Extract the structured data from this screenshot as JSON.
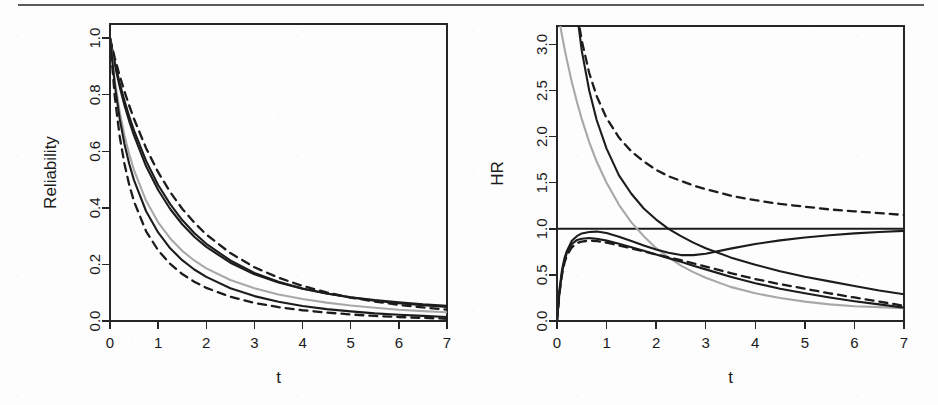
{
  "figure": {
    "panel_count": 2,
    "background_color": "#fdfdfd",
    "rule_color": "#5a5a5a",
    "ink_color": "#1c1c1c",
    "gray_curve_color": "#a8a8a8"
  },
  "chart_data": [
    {
      "type": "line",
      "panel_name": "reliability-panel",
      "title": "",
      "xlabel": "t",
      "ylabel": "Reliability",
      "xlim": [
        0,
        7
      ],
      "ylim": [
        0,
        1.05
      ],
      "xticks": [
        0,
        1,
        2,
        3,
        4,
        5,
        6,
        7
      ],
      "xticklabels": [
        "0",
        "1",
        "2",
        "3",
        "4",
        "5",
        "6",
        "7"
      ],
      "yticks": [
        0.0,
        0.2,
        0.4,
        0.6,
        0.8,
        1.0
      ],
      "yticklabels": [
        "0.0",
        "0.2",
        "0.4",
        "0.6",
        "0.8",
        "1.0"
      ],
      "grid": false,
      "legend": "none",
      "x": [
        0,
        0.1,
        0.2,
        0.3,
        0.4,
        0.5,
        0.75,
        1,
        1.25,
        1.5,
        1.75,
        2,
        2.5,
        3,
        3.5,
        4,
        4.5,
        5,
        5.5,
        6,
        6.5,
        7
      ],
      "series": [
        {
          "name": "upper-dashed-bound",
          "style": "dashed",
          "color": "#1c1c1c",
          "values": [
            1.0,
            0.93,
            0.868,
            0.812,
            0.761,
            0.714,
            0.611,
            0.526,
            0.456,
            0.397,
            0.348,
            0.306,
            0.24,
            0.19,
            0.153,
            0.124,
            0.101,
            0.083,
            0.069,
            0.057,
            0.048,
            0.04
          ]
        },
        {
          "name": "upper-solid-a",
          "style": "solid",
          "color": "#1c1c1c",
          "values": [
            1.0,
            0.914,
            0.842,
            0.779,
            0.723,
            0.673,
            0.566,
            0.481,
            0.413,
            0.357,
            0.311,
            0.273,
            0.214,
            0.17,
            0.139,
            0.115,
            0.097,
            0.083,
            0.072,
            0.063,
            0.056,
            0.05
          ]
        },
        {
          "name": "upper-solid-b",
          "style": "solid",
          "color": "#1c1c1c",
          "values": [
            1.0,
            0.906,
            0.829,
            0.763,
            0.706,
            0.655,
            0.547,
            0.463,
            0.396,
            0.342,
            0.298,
            0.262,
            0.206,
            0.165,
            0.136,
            0.114,
            0.097,
            0.084,
            0.074,
            0.066,
            0.059,
            0.054
          ]
        },
        {
          "name": "gray-median",
          "style": "solid",
          "color": "#a8a8a8",
          "values": [
            1.0,
            0.851,
            0.741,
            0.657,
            0.589,
            0.533,
            0.425,
            0.349,
            0.292,
            0.248,
            0.214,
            0.186,
            0.145,
            0.116,
            0.094,
            0.078,
            0.065,
            0.055,
            0.047,
            0.04,
            0.035,
            0.031
          ]
        },
        {
          "name": "lower-solid",
          "style": "solid",
          "color": "#1c1c1c",
          "values": [
            1.0,
            0.834,
            0.716,
            0.626,
            0.555,
            0.497,
            0.388,
            0.313,
            0.257,
            0.215,
            0.182,
            0.156,
            0.116,
            0.088,
            0.068,
            0.053,
            0.042,
            0.034,
            0.027,
            0.022,
            0.018,
            0.014
          ]
        },
        {
          "name": "lower-dashed-bound",
          "style": "dashed",
          "color": "#1c1c1c",
          "values": [
            1.0,
            0.792,
            0.654,
            0.556,
            0.481,
            0.422,
            0.317,
            0.25,
            0.202,
            0.166,
            0.139,
            0.117,
            0.086,
            0.064,
            0.049,
            0.038,
            0.03,
            0.023,
            0.018,
            0.014,
            0.011,
            0.008
          ]
        }
      ]
    },
    {
      "type": "line",
      "panel_name": "hr-panel",
      "title": "",
      "xlabel": "t",
      "ylabel": "HR",
      "xlim": [
        0,
        7
      ],
      "ylim": [
        0,
        3.2
      ],
      "xticks": [
        0,
        1,
        2,
        3,
        4,
        5,
        6,
        7
      ],
      "xticklabels": [
        "0",
        "1",
        "2",
        "3",
        "4",
        "5",
        "6",
        "7"
      ],
      "yticks": [
        0.0,
        0.5,
        1.0,
        1.5,
        2.0,
        2.5,
        3.0
      ],
      "yticklabels": [
        "0.0",
        "0.5",
        "1.0",
        "1.5",
        "2.0",
        "2.5",
        "3.0"
      ],
      "grid": false,
      "legend": "none",
      "x": [
        0,
        0.05,
        0.1,
        0.15,
        0.2,
        0.3,
        0.4,
        0.5,
        0.65,
        0.8,
        1,
        1.25,
        1.5,
        1.75,
        2,
        2.25,
        2.5,
        2.75,
        3,
        3.5,
        4,
        4.5,
        5,
        5.5,
        6,
        6.5,
        7
      ],
      "series": [
        {
          "name": "constant-hr-one",
          "style": "solid",
          "color": "#1c1c1c",
          "values": [
            1.0,
            1.0,
            1.0,
            1.0,
            1.0,
            1.0,
            1.0,
            1.0,
            1.0,
            1.0,
            1.0,
            1.0,
            1.0,
            1.0,
            1.0,
            1.0,
            1.0,
            1.0,
            1.0,
            1.0,
            1.0,
            1.0,
            1.0,
            1.0,
            1.0,
            1.0,
            1.0
          ]
        },
        {
          "name": "upper-dashed-decay",
          "style": "dashed",
          "color": "#1c1c1c",
          "values": [
            6.2,
            5.6,
            5.1,
            4.7,
            4.35,
            3.78,
            3.36,
            3.04,
            2.69,
            2.44,
            2.2,
            1.99,
            1.84,
            1.73,
            1.64,
            1.57,
            1.52,
            1.47,
            1.43,
            1.36,
            1.31,
            1.27,
            1.24,
            1.21,
            1.19,
            1.17,
            1.15
          ]
        },
        {
          "name": "steep-solid-decay",
          "style": "solid",
          "color": "#1c1c1c",
          "values": [
            8.0,
            6.9,
            5.9,
            5.2,
            4.7,
            3.9,
            3.35,
            2.93,
            2.5,
            2.18,
            1.87,
            1.58,
            1.38,
            1.22,
            1.1,
            1.0,
            0.92,
            0.85,
            0.79,
            0.69,
            0.61,
            0.54,
            0.48,
            0.43,
            0.38,
            0.33,
            0.29
          ]
        },
        {
          "name": "gray-decay",
          "style": "solid",
          "color": "#a8a8a8",
          "values": [
            3.4,
            3.25,
            3.1,
            2.96,
            2.83,
            2.59,
            2.38,
            2.19,
            1.94,
            1.73,
            1.5,
            1.26,
            1.07,
            0.92,
            0.79,
            0.69,
            0.6,
            0.53,
            0.47,
            0.37,
            0.3,
            0.25,
            0.21,
            0.18,
            0.16,
            0.15,
            0.14
          ]
        },
        {
          "name": "rising-then-dip-solid",
          "style": "solid",
          "color": "#1c1c1c",
          "values": [
            0.0,
            0.34,
            0.55,
            0.68,
            0.76,
            0.87,
            0.92,
            0.95,
            0.965,
            0.97,
            0.955,
            0.915,
            0.868,
            0.82,
            0.775,
            0.74,
            0.715,
            0.715,
            0.73,
            0.785,
            0.835,
            0.875,
            0.905,
            0.93,
            0.95,
            0.965,
            0.978
          ]
        },
        {
          "name": "rising-then-decay-dashed",
          "style": "dashed",
          "color": "#1c1c1c",
          "values": [
            0.0,
            0.3,
            0.5,
            0.63,
            0.71,
            0.8,
            0.845,
            0.862,
            0.872,
            0.868,
            0.85,
            0.82,
            0.788,
            0.755,
            0.722,
            0.69,
            0.66,
            0.625,
            0.59,
            0.52,
            0.455,
            0.4,
            0.35,
            0.3,
            0.255,
            0.21,
            0.165
          ]
        },
        {
          "name": "lower-solid-decay",
          "style": "solid",
          "color": "#1c1c1c",
          "values": [
            0.0,
            0.31,
            0.52,
            0.655,
            0.74,
            0.835,
            0.878,
            0.893,
            0.9,
            0.893,
            0.872,
            0.838,
            0.8,
            0.762,
            0.722,
            0.682,
            0.642,
            0.6,
            0.56,
            0.48,
            0.41,
            0.35,
            0.3,
            0.255,
            0.215,
            0.18,
            0.145
          ]
        }
      ]
    }
  ]
}
